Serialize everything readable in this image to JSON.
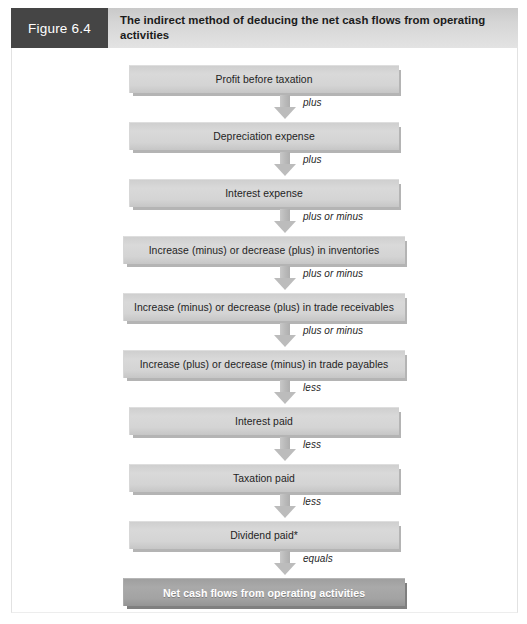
{
  "header": {
    "figure_label": "Figure 6.4",
    "title": "The indirect method of deducing the net cash flows from operating activities",
    "label_bg_color": "#454545",
    "title_bg_color": "#d6d6d6"
  },
  "chart_data": {
    "type": "diagram",
    "title": "The indirect method of deducing the net cash flows from operating activities",
    "subtitle": "",
    "xlabel": "",
    "ylabel": "",
    "orientation": "vertical-flow",
    "box_fill_color": "#d4d4d4",
    "final_box_fill_color": "#a3a3a3",
    "arrow_color": "#bcbcbc",
    "nodes": [
      {
        "label": "Profit before taxation",
        "width": "narrow",
        "emphasis": false
      },
      {
        "label": "Depreciation expense",
        "width": "narrow",
        "emphasis": false
      },
      {
        "label": "Interest expense",
        "width": "narrow",
        "emphasis": false
      },
      {
        "label": "Increase (minus) or decrease (plus) in inventories",
        "width": "wide",
        "emphasis": false
      },
      {
        "label": "Increase (minus) or decrease (plus) in trade receivables",
        "width": "wide",
        "emphasis": false
      },
      {
        "label": "Increase (plus) or decrease (minus) in trade payables",
        "width": "wide",
        "emphasis": false
      },
      {
        "label": "Interest paid",
        "width": "narrow",
        "emphasis": false
      },
      {
        "label": "Taxation paid",
        "width": "narrow",
        "emphasis": false
      },
      {
        "label": "Dividend paid*",
        "width": "narrow",
        "emphasis": false
      },
      {
        "label": "Net cash flows from operating activities",
        "width": "final",
        "emphasis": true
      }
    ],
    "connectors": [
      {
        "label": "plus"
      },
      {
        "label": "plus"
      },
      {
        "label": "plus or minus"
      },
      {
        "label": "plus or minus"
      },
      {
        "label": "plus or minus"
      },
      {
        "label": "less"
      },
      {
        "label": "less"
      },
      {
        "label": "less"
      },
      {
        "label": "equals"
      }
    ]
  }
}
